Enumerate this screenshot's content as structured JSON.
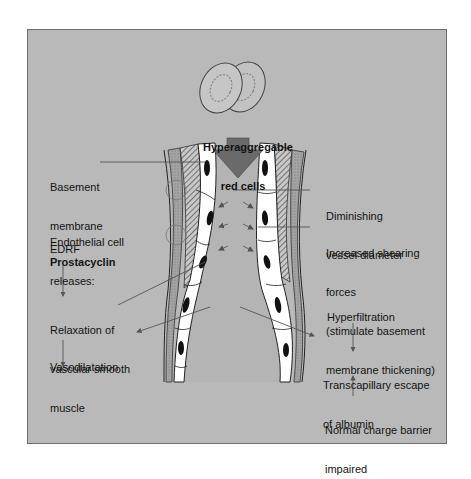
{
  "diagram": {
    "colors": {
      "background": "#b9b9b9",
      "lumen": "#b4b4b4",
      "arrow_fill": "#6a6a6a",
      "leader_line": "#555555",
      "endothelium": "#ffffff",
      "nucleus": "#111111",
      "text": "#141414"
    },
    "top_label": {
      "line1": "Hyperaggregable",
      "line2": "red cells"
    },
    "left_labels": {
      "basement_membrane": {
        "line1": "Basement",
        "line2": "membrane"
      },
      "endothelial": {
        "line1": "Endothelial cell",
        "line2": "releases:"
      },
      "edrf": "EDRF",
      "prostacyclin": "Prostacyclin",
      "relaxation": {
        "line1": "Relaxation of",
        "line2": "vascular smooth",
        "line3": "muscle"
      },
      "vasodilatation": "Vasodilatation"
    },
    "right_labels": {
      "diminishing": {
        "line1": "Diminishing",
        "line2": "vessel diameter"
      },
      "shearing": {
        "line1": "Increased shearing",
        "line2": "forces",
        "line3": "(stimulate basement",
        "line4": "membrane thickening)"
      },
      "hyperfiltration": "Hyperfiltration",
      "transcapillary": {
        "line1": "Transcapillary escape",
        "line2": "of albumin"
      },
      "charge_barrier": {
        "line1": "Normal charge barrier",
        "line2": "impaired"
      }
    },
    "icons": [
      "red-blood-cell-icon",
      "down-arrow-icon",
      "blood-vessel-icon"
    ]
  }
}
